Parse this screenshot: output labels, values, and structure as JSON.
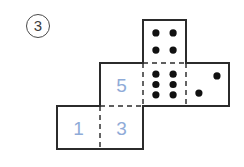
{
  "problem": {
    "label": "3",
    "marker_style": "circled-number"
  },
  "figure": {
    "type": "cube-net-dice",
    "grid": {
      "cell_size": 43,
      "origin_x": 57,
      "origin_y": 20
    },
    "faces": [
      {
        "id": "face-top",
        "name": "top-face-four-pips",
        "col": 2,
        "row": 0,
        "content_kind": "pips",
        "pip_count": 4,
        "pip_layout": "2x2",
        "label": ""
      },
      {
        "id": "face-middle-left",
        "name": "middle-left-face-five",
        "col": 1,
        "row": 1,
        "content_kind": "number",
        "pip_count": 0,
        "pip_layout": "",
        "label": "5"
      },
      {
        "id": "face-middle-center",
        "name": "middle-center-face-six-pips",
        "col": 2,
        "row": 1,
        "content_kind": "pips",
        "pip_count": 6,
        "pip_layout": "2x3",
        "label": ""
      },
      {
        "id": "face-middle-right",
        "name": "middle-right-face-two-pips",
        "col": 3,
        "row": 1,
        "content_kind": "pips",
        "pip_count": 2,
        "pip_layout": "diagonal",
        "label": ""
      },
      {
        "id": "face-bottom-left",
        "name": "bottom-left-face-one",
        "col": 0,
        "row": 2,
        "content_kind": "number",
        "pip_count": 0,
        "pip_layout": "",
        "label": "1"
      },
      {
        "id": "face-bottom-right",
        "name": "bottom-right-face-three",
        "col": 1,
        "row": 2,
        "content_kind": "number",
        "pip_count": 0,
        "pip_layout": "",
        "label": "3"
      }
    ],
    "colors": {
      "outline": "#2b2b2b",
      "fold_line": "#555555",
      "pip": "#111111",
      "number_text": "#8fabd8",
      "background": "#ffffff",
      "problem_marker": "#3c3c3c"
    }
  }
}
